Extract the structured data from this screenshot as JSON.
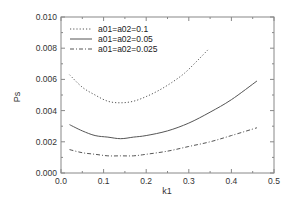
{
  "chart_data": {
    "type": "line",
    "title": "",
    "xlabel": "k1",
    "ylabel": "Ps",
    "xlim": [
      0.0,
      0.5
    ],
    "ylim": [
      0.0,
      0.01
    ],
    "xticks": [
      "0.0",
      "0.1",
      "0.2",
      "0.3",
      "0.4",
      "0.5"
    ],
    "yticks": [
      "0.000",
      "0.002",
      "0.004",
      "0.006",
      "0.008",
      "0.010"
    ],
    "grid": false,
    "legend_position": "upper left",
    "series": [
      {
        "name": "a01=a02=0.1",
        "style": "dotted",
        "x": [
          0.02,
          0.05,
          0.08,
          0.11,
          0.14,
          0.17,
          0.2,
          0.23,
          0.26,
          0.29,
          0.32,
          0.345
        ],
        "y": [
          0.0063,
          0.0055,
          0.005,
          0.0046,
          0.0045,
          0.0046,
          0.0049,
          0.0053,
          0.0058,
          0.0064,
          0.0072,
          0.0079
        ]
      },
      {
        "name": "a01=a02=0.05",
        "style": "solid",
        "x": [
          0.02,
          0.05,
          0.08,
          0.11,
          0.14,
          0.17,
          0.2,
          0.25,
          0.3,
          0.35,
          0.4,
          0.46
        ],
        "y": [
          0.0031,
          0.0027,
          0.0024,
          0.0023,
          0.0022,
          0.0023,
          0.0024,
          0.0027,
          0.0032,
          0.0039,
          0.0047,
          0.0059
        ]
      },
      {
        "name": "a01=a02=0.025",
        "style": "dashdot",
        "x": [
          0.02,
          0.05,
          0.08,
          0.11,
          0.14,
          0.17,
          0.2,
          0.25,
          0.3,
          0.35,
          0.4,
          0.46
        ],
        "y": [
          0.0015,
          0.0013,
          0.0012,
          0.0011,
          0.0011,
          0.0011,
          0.0012,
          0.0014,
          0.0017,
          0.002,
          0.0024,
          0.0029
        ]
      }
    ]
  },
  "colors": {
    "axis": "#888888",
    "series_line": "#555555"
  }
}
